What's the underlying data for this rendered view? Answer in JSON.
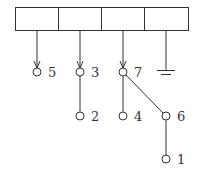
{
  "diagram": {
    "register": {
      "cells": 4,
      "x": 15,
      "y": 7,
      "width": 173,
      "height": 23
    },
    "nodes": [
      {
        "id": "5",
        "label": "5",
        "x": 37,
        "y": 72
      },
      {
        "id": "3",
        "label": "3",
        "x": 80,
        "y": 72
      },
      {
        "id": "7",
        "label": "7",
        "x": 123,
        "y": 72
      },
      {
        "id": "2",
        "label": "2",
        "x": 80,
        "y": 116
      },
      {
        "id": "4",
        "label": "4",
        "x": 123,
        "y": 116
      },
      {
        "id": "6",
        "label": "6",
        "x": 166,
        "y": 116
      },
      {
        "id": "1",
        "label": "1",
        "x": 166,
        "y": 159
      }
    ],
    "pointers": [
      {
        "from_cell": 0,
        "to": "5"
      },
      {
        "from_cell": 1,
        "to": "3"
      },
      {
        "from_cell": 2,
        "to": "7"
      },
      {
        "from_cell": 3,
        "to": "ground"
      }
    ],
    "edges": [
      {
        "from": "3",
        "to": "2"
      },
      {
        "from": "7",
        "to": "4"
      },
      {
        "from": "7",
        "to": "6"
      },
      {
        "from": "6",
        "to": "1"
      }
    ],
    "ground": {
      "x": 166,
      "y": 72
    },
    "colors": {
      "stroke": "#333333",
      "background": "#ffffff"
    }
  }
}
